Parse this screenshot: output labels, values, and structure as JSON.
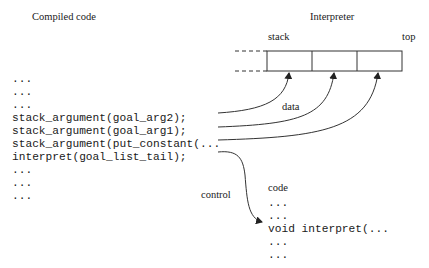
{
  "titles": {
    "compiled_code": "Compiled code",
    "interpreter": "Interpreter"
  },
  "stack": {
    "label_left": "stack",
    "label_right": "top",
    "cells": 3
  },
  "compiled_code_lines": [
    "...",
    "...",
    "...",
    "stack_argument(goal_arg2);",
    "stack_argument(goal_arg1);",
    "stack_argument(put_constant(...",
    "interpret(goal_list_tail);",
    "...",
    "...",
    "..."
  ],
  "arrow_labels": {
    "data": "data",
    "control": "control"
  },
  "interpreter_code": {
    "heading": "code",
    "lines": [
      "...",
      "...",
      "void interpret(...",
      "...",
      "..."
    ]
  },
  "colors": {
    "line": "#333333",
    "text": "#1a1a1a",
    "background": "#ffffff"
  }
}
